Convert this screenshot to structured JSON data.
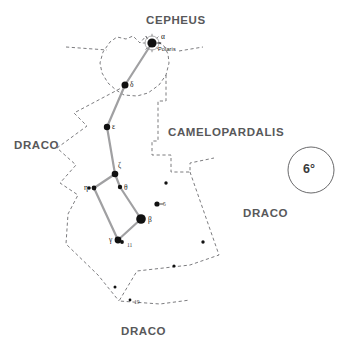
{
  "figure": {
    "kind": "star-chart",
    "constellation": "Ursa Minor",
    "background_color": "#ffffff",
    "boundary_color": "#6d6d70",
    "asterism_color": "#a0a0a2",
    "star_color": "#111111"
  },
  "constellation_labels": [
    {
      "name": "cepheus",
      "text": "CEPHEUS",
      "x": 146,
      "y": 14
    },
    {
      "name": "camelopardalis",
      "text": "CAMELOPARDALIS",
      "x": 168,
      "y": 126
    },
    {
      "name": "draco-west",
      "text": "DRACO",
      "x": 14,
      "y": 139
    },
    {
      "name": "draco-east",
      "text": "DRACO",
      "x": 243,
      "y": 207
    },
    {
      "name": "draco-south",
      "text": "DRACO",
      "x": 121,
      "y": 325
    }
  ],
  "scale_marker": {
    "name": "scale-circle",
    "label": "6°",
    "cx": 311,
    "cy": 170,
    "r": 23
  },
  "chart_data": {
    "type": "scatter",
    "title": "",
    "stars": [
      {
        "id": "alpha",
        "label": "α",
        "name_label": "Polaris",
        "x": 152,
        "y": 43,
        "r": 4.6,
        "halo": true,
        "label_dx": 9,
        "label_dy": -7,
        "name_dx": 6,
        "name_dy": 3,
        "tick": true
      },
      {
        "id": "delta",
        "label": "δ",
        "name_label": "",
        "x": 125,
        "y": 85,
        "r": 3.5,
        "halo": false,
        "label_dx": 5,
        "label_dy": -1
      },
      {
        "id": "epsilon",
        "label": "ε",
        "name_label": "",
        "x": 107,
        "y": 127,
        "r": 3.2,
        "halo": false,
        "label_dx": 5,
        "label_dy": -1
      },
      {
        "id": "zeta",
        "label": "ζ",
        "name_label": "",
        "x": 115,
        "y": 174,
        "r": 3.3,
        "halo": false,
        "label_dx": 3,
        "label_dy": -9
      },
      {
        "id": "theta",
        "label": "θ",
        "name_label": "",
        "x": 120,
        "y": 187,
        "r": 2.2,
        "halo": false,
        "label_dx": 4,
        "label_dy": 0
      },
      {
        "id": "eta",
        "label": "η",
        "name_label": "",
        "x": 94,
        "y": 188,
        "r": 2.4,
        "halo": false,
        "label_dx": -10,
        "label_dy": -1
      },
      {
        "id": "eta-b",
        "label": "",
        "name_label": "",
        "x": 89,
        "y": 188,
        "r": 1.8,
        "halo": false,
        "label_dx": 0,
        "label_dy": 0
      },
      {
        "id": "beta",
        "label": "β",
        "name_label": "",
        "x": 141,
        "y": 219,
        "r": 4.8,
        "halo": false,
        "label_dx": 7,
        "label_dy": 0
      },
      {
        "id": "gamma",
        "label": "γ",
        "name_label": "",
        "x": 118,
        "y": 240,
        "r": 3.4,
        "halo": false,
        "label_dx": -9,
        "label_dy": -1
      },
      {
        "id": "11umi",
        "label": "11",
        "name_label": "",
        "x": 122,
        "y": 242,
        "r": 1.9,
        "halo": false,
        "label_dx": 5,
        "label_dy": 3,
        "tiny": true
      },
      {
        "id": "5umi",
        "label": "5",
        "name_label": "",
        "x": 157,
        "y": 204,
        "r": 2.6,
        "halo": false,
        "label_dx": 6,
        "label_dy": 0,
        "tiny": true,
        "tick": true
      },
      {
        "id": "field-1",
        "label": "",
        "name_label": "",
        "x": 166,
        "y": 183,
        "r": 1.7,
        "halo": false
      },
      {
        "id": "field-2",
        "label": "",
        "name_label": "",
        "x": 203,
        "y": 242,
        "r": 1.7,
        "halo": false
      },
      {
        "id": "field-3",
        "label": "",
        "name_label": "",
        "x": 174,
        "y": 266,
        "r": 1.6,
        "halo": false
      },
      {
        "id": "field-4",
        "label": "",
        "name_label": "",
        "x": 115,
        "y": 287,
        "r": 1.5,
        "halo": false
      },
      {
        "id": "19umi",
        "label": "19",
        "name_label": "",
        "x": 130,
        "y": 300,
        "r": 1.4,
        "halo": false,
        "label_dx": 4,
        "label_dy": 2,
        "tiny": true
      }
    ],
    "asterism_lines": [
      {
        "from": "alpha",
        "to": "delta"
      },
      {
        "from": "delta",
        "to": "epsilon"
      },
      {
        "from": "epsilon",
        "to": "zeta"
      },
      {
        "from": "zeta",
        "to": "eta"
      },
      {
        "from": "zeta",
        "to": "theta"
      },
      {
        "from": "theta",
        "to": "beta"
      },
      {
        "from": "eta",
        "to": "gamma"
      },
      {
        "from": "gamma",
        "to": "beta"
      }
    ],
    "boundary_paths": [
      "M 150 44 L 146 36 L 140 43 L 133 36 L 126 39 L 117 37 L 110 42 L 103 52 L 100 63 L 102 73 L 108 83 L 116 90 L 124 95 L 137 96 L 148 93 L 159 85 L 166 75 L 169 63 L 168 54 L 164 46 L 158 42",
      "M 66 47 L 107 50",
      "M 179 51 L 203 47",
      "M 166 75 L 166 101 L 158 101 L 158 141 L 152 141 L 152 155 L 171 155 L 171 172 L 190 172 L 190 163 L 214 158",
      "M 190 172 L 219 255 L 190 265 L 137 271 L 119 301 L 160 304 L 190 300",
      "M 125 86 L 74 113 L 87 126 L 72 137 L 57 148 L 76 165 L 60 183 L 78 195 L 68 214 L 66 244 L 98 275 L 119 301"
    ]
  }
}
